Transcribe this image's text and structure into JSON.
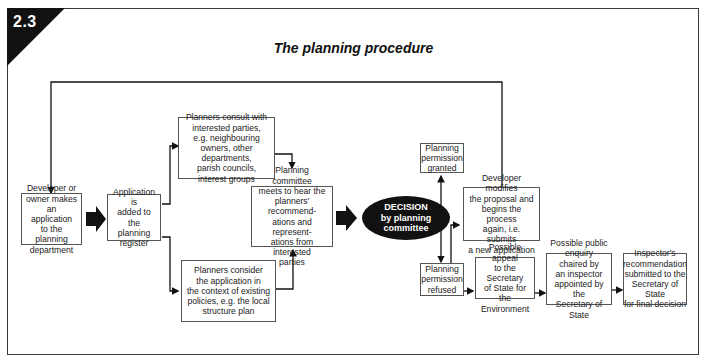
{
  "figure": {
    "number": "2.3",
    "title": "The planning procedure"
  },
  "boxes": {
    "developer_applies": "Developer or\nowner makes\nan application\nto the planning\ndepartment",
    "application_register": "Application is\nadded to the\nplanning\nregister",
    "planners_consult": "Planners consult with\ninterested parties,\ne.g. neighbouring\nowners, other departments,\nparish councils,\ninterest groups",
    "planners_consider": "Planners consider\nthe application in\nthe context of existing\npolicies, e.g. the local\nstructure plan",
    "committee_meets": "Planning committee\nmeets to hear the\nplanners' recommend-\nations and represent-\nations from interested\nparties",
    "decision": "DECISION\nby planning\ncommittee",
    "permission_granted": "Planning\npermission\ngranted",
    "developer_modifies": "Developer modifies\nthe proposal and\nbegins the process\nagain, i.e. submits\na new application",
    "permission_refused": "Planning\npermission\nrefused",
    "possible_appeal": "Possible appeal\nto the Secretary\nof State for the\nEnvironment",
    "public_enquiry": "Possible public\nenquiry chaired by\nan inspector\nappointed by the\nSecretary of State",
    "inspector_recommendation": "Inspector's\nrecommendation\nsubmitted to the\nSecretary of State\nfor final decision"
  },
  "colors": {
    "ink": "#111111",
    "box_border": "#555555",
    "background": "#ffffff"
  }
}
